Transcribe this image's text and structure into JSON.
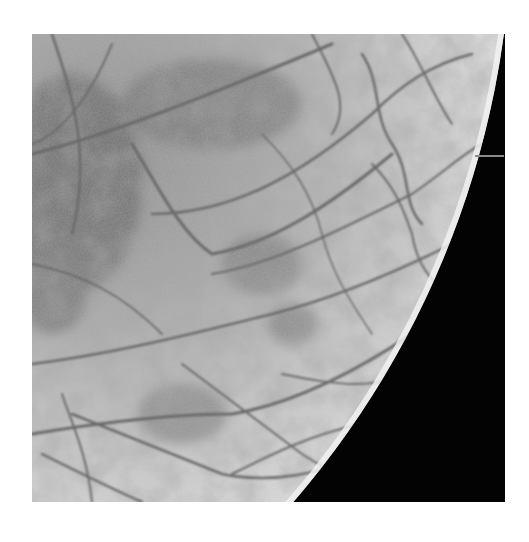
{
  "image": {
    "subject": "Icy moon surface with dark lineae (crack ridges) and limb against black space",
    "style": "grayscale photograph",
    "colors": {
      "background": "#ffffff",
      "space": "#030303",
      "surface_light": "#dcdcdc",
      "surface_mid": "#a8a8a8",
      "surface_dark": "#6e6e6e",
      "crack": "#6a6a6a"
    },
    "frame": {
      "left": 32,
      "top": 34,
      "width": 473,
      "height": 468
    }
  }
}
